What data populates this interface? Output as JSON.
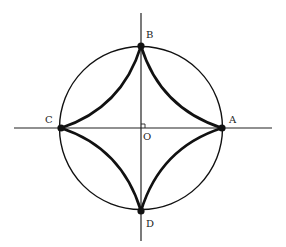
{
  "diagram": {
    "type": "geometry",
    "colors": {
      "stroke": "#111111",
      "background": "#ffffff"
    },
    "center": {
      "label": "O",
      "x": 141,
      "y": 128
    },
    "radius": 81,
    "axes": {
      "horizontal": {
        "x1": 14,
        "x2": 272,
        "y": 128
      },
      "vertical": {
        "x": 141,
        "y1": 13,
        "y2": 241
      }
    },
    "points": [
      {
        "label": "A",
        "x": 222,
        "y": 128,
        "label_x": 229,
        "label_y": 123
      },
      {
        "label": "B",
        "x": 141,
        "y": 46,
        "label_x": 147,
        "label_y": 38
      },
      {
        "label": "C",
        "x": 61,
        "y": 128,
        "label_x": 45,
        "label_y": 123
      },
      {
        "label": "D",
        "x": 141,
        "y": 211,
        "label_x": 147,
        "label_y": 226
      }
    ],
    "right_angle_marker": true
  },
  "labels": {
    "A": "A",
    "B": "B",
    "C": "C",
    "D": "D",
    "O": "O"
  }
}
